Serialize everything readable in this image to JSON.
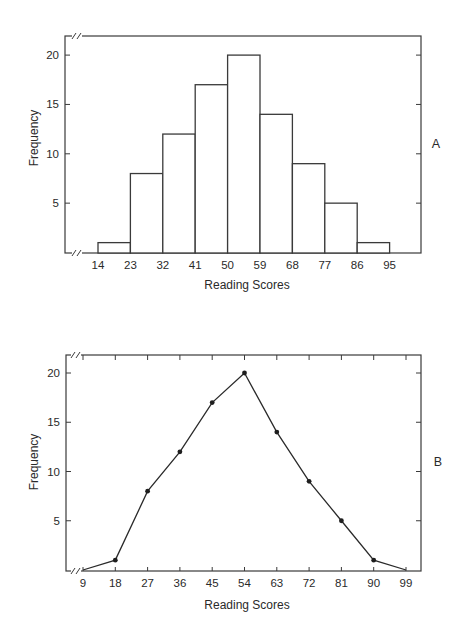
{
  "chart_data": [
    {
      "type": "bar",
      "panel_label": "A",
      "title": "",
      "xlabel": "Reading Scores",
      "ylabel": "Frequency",
      "categories": [
        "14-23",
        "23-32",
        "32-41",
        "41-50",
        "50-59",
        "59-68",
        "68-77",
        "77-86",
        "86-95"
      ],
      "bin_edges": [
        14,
        23,
        32,
        41,
        50,
        59,
        68,
        77,
        86,
        95
      ],
      "values": [
        1,
        8,
        12,
        17,
        20,
        14,
        9,
        5,
        1
      ],
      "x_ticks": [
        "14",
        "23",
        "32",
        "41",
        "50",
        "59",
        "68",
        "77",
        "86",
        "95"
      ],
      "y_ticks": [
        "5",
        "10",
        "15",
        "20"
      ],
      "ylim": [
        0,
        22
      ],
      "axis_break": true,
      "grid": false,
      "legend": null
    },
    {
      "type": "line",
      "panel_label": "B",
      "title": "",
      "xlabel": "Reading Scores",
      "ylabel": "Frequency",
      "x": [
        9,
        18,
        27,
        36,
        45,
        54,
        63,
        72,
        81,
        90,
        99
      ],
      "values": [
        0,
        1,
        8,
        12,
        17,
        20,
        14,
        9,
        5,
        1,
        0
      ],
      "markers": true,
      "x_ticks": [
        "9",
        "18",
        "27",
        "36",
        "45",
        "54",
        "63",
        "72",
        "81",
        "90",
        "99"
      ],
      "y_ticks": [
        "5",
        "10",
        "15",
        "20"
      ],
      "ylim": [
        0,
        22
      ],
      "axis_break": true,
      "grid": false,
      "legend": null
    }
  ]
}
